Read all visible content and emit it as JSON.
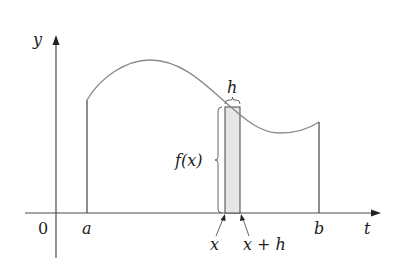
{
  "figure": {
    "type": "area-under-curve-diagram",
    "axes": {
      "horizontal_label": "t",
      "vertical_label": "y",
      "origin_label": "0"
    },
    "interval": {
      "left_label": "a",
      "right_label": "b"
    },
    "strip": {
      "left_label": "x",
      "right_label": "x + h",
      "width_label": "h",
      "height_label": "f(x)"
    },
    "colors": {
      "axis": "#4a4a4a",
      "curve": "#8a8a8a",
      "strip_fill": "#e6e6e6",
      "strip_edge": "#444444",
      "text": "#222222"
    }
  }
}
